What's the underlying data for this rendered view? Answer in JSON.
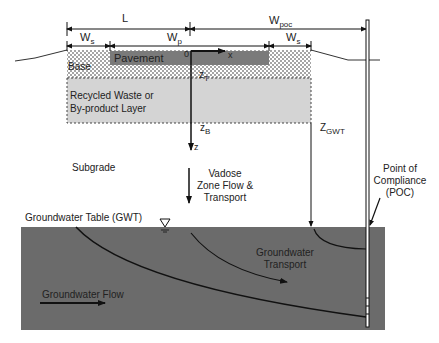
{
  "dimensions": {
    "L": "L",
    "W_s_left": "W",
    "W_s_left_sub": "s",
    "W_p": "W",
    "W_p_sub": "p",
    "W_poc": "W",
    "W_poc_sub": "poc",
    "W_s_right": "W",
    "W_s_right_sub": "s"
  },
  "layers": {
    "pavement": "Pavement",
    "base": "Base",
    "recycled_line1": "Recycled Waste or",
    "recycled_line2": "By-product Layer",
    "subgrade": "Subgrade"
  },
  "axes": {
    "origin": "0",
    "x": "x",
    "z": "z",
    "zT": "z",
    "zT_sub": "T",
    "zB": "z",
    "zB_sub": "B",
    "zGWT": "Z",
    "zGWT_sub": "GWT"
  },
  "labels": {
    "vadose_line1": "Vadose",
    "vadose_line2": "Zone Flow &",
    "vadose_line3": "Transport",
    "poc_line1": "Point of",
    "poc_line2": "Compliance",
    "poc_line3": "(POC)",
    "gwt": "Groundwater Table (GWT)",
    "gw_transport_line1": "Groundwater",
    "gw_transport_line2": "Transport",
    "gw_flow": "Groundwater Flow"
  },
  "colors": {
    "pavement": "#7a7a7a",
    "waste_layer": "#d4d4d4",
    "groundwater": "#6b6b6b",
    "line": "#111111"
  }
}
